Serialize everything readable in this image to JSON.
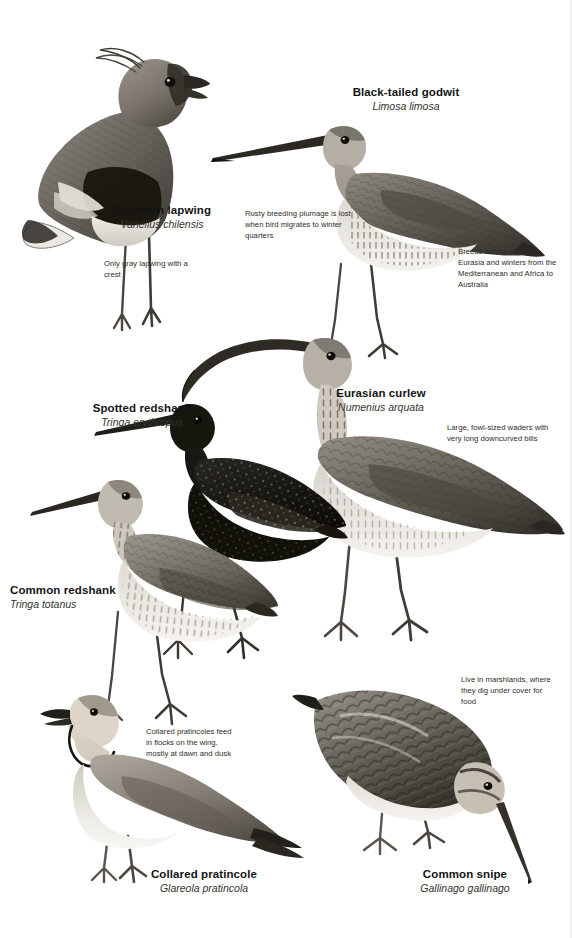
{
  "page": {
    "width": 572,
    "height": 938,
    "background": "#ffffff",
    "kind": "field-guide-plate",
    "subject": "waders"
  },
  "palette": {
    "ink": "#1a1a1a",
    "note_text": "#2d2d2b",
    "latin_text": "#33332f",
    "plume_dark": "#2a2724",
    "plume_mid": "#6e6a63",
    "plume_light": "#b9b4ab",
    "paper": "#ffffff"
  },
  "species": [
    {
      "id": "southern-lapwing",
      "common": "Southern lapwing",
      "latin": "Vanellus chilensis",
      "label_x": 98,
      "label_y": 204,
      "label_align": "center",
      "label_width": 128
    },
    {
      "id": "black-tailed-godwit",
      "common": "Black-tailed godwit",
      "latin": "Limosa limosa",
      "label_x": 336,
      "label_y": 86,
      "label_align": "center",
      "label_width": 140
    },
    {
      "id": "spotted-redshank",
      "common": "Spotted redshank",
      "latin": "Tringa erythropus",
      "label_x": 86,
      "label_y": 402,
      "label_align": "center",
      "label_width": 112
    },
    {
      "id": "eurasian-curlew",
      "common": "Eurasian curlew",
      "latin": "Numenius arquata",
      "label_x": 326,
      "label_y": 387,
      "label_align": "center",
      "label_width": 110
    },
    {
      "id": "common-redshank",
      "common": "Common redshank",
      "latin": "Tringa totanus",
      "label_x": 10,
      "label_y": 584,
      "label_align": "left",
      "label_width": 120
    },
    {
      "id": "collared-pratincole",
      "common": "Collared pratincole",
      "latin": "Glareola pratincola",
      "label_x": 145,
      "label_y": 868,
      "label_align": "center",
      "label_width": 118
    },
    {
      "id": "common-snipe",
      "common": "Common snipe",
      "latin": "Gallinago gallinago",
      "label_x": 404,
      "label_y": 868,
      "label_align": "center",
      "label_width": 122
    }
  ],
  "notes": [
    {
      "id": "note-lapwing",
      "text": "Only gray lapwing with a crest",
      "x": 104,
      "y": 258,
      "width": 100
    },
    {
      "id": "note-godwit-plumage",
      "text": "Rusty breeding plumage is lost when bird migrates to winter quarters",
      "x": 245,
      "y": 208,
      "width": 118
    },
    {
      "id": "note-godwit-range",
      "text": "Breeds across northern Eurasia and winters from the Mediterranean and Africa to Australia",
      "x": 458,
      "y": 246,
      "width": 106
    },
    {
      "id": "note-curlew",
      "text": "Large, fowl-sized waders with very long downcurved bills",
      "x": 447,
      "y": 422,
      "width": 118
    },
    {
      "id": "note-pratincole",
      "text": "Collared pratincoles feed in flocks on the wing, mostly at dawn and dusk",
      "x": 146,
      "y": 726,
      "width": 90
    },
    {
      "id": "note-snipe",
      "text": "Live in marshlands, where they dig under cover for food",
      "x": 461,
      "y": 674,
      "width": 90
    }
  ]
}
